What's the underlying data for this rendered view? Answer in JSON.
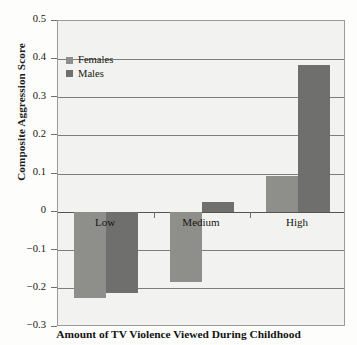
{
  "chart_data": {
    "type": "bar",
    "title": "",
    "xlabel": "Amount of TV Violence Viewed During Childhood",
    "ylabel": "Composite Aggression Score",
    "categories": [
      "Low",
      "Medium",
      "High"
    ],
    "series": [
      {
        "name": "Females",
        "color": "#8e8e8b",
        "values": [
          -0.224,
          -0.182,
          0.095
        ]
      },
      {
        "name": "Males",
        "color": "#6f6f6d",
        "values": [
          -0.211,
          0.026,
          0.384
        ]
      }
    ],
    "ylim": [
      -0.3,
      0.5
    ],
    "ytick_labels": [
      "0.5",
      "0.4",
      "0.3",
      "0.2",
      "0.1",
      "0",
      "−0.1",
      "−0.2",
      "−0.3"
    ],
    "ytick_values": [
      0.5,
      0.4,
      0.3,
      0.2,
      0.1,
      0,
      -0.1,
      -0.2,
      -0.3
    ],
    "grid": true,
    "legend_position": "top-left",
    "legend": [
      "Females",
      "Males"
    ],
    "plot_background": "#f2f2f0",
    "grid_color": "#7d7d79",
    "axis_color": "#9a9a96"
  }
}
